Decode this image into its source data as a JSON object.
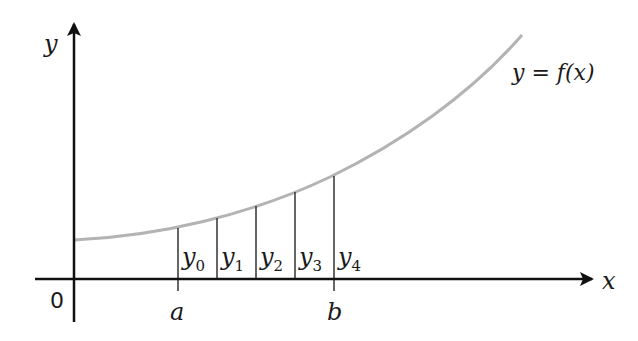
{
  "diagram": {
    "axes": {
      "x_label": "x",
      "y_label": "y",
      "origin_label": "0"
    },
    "curve": {
      "label": "y = f(x)",
      "color": "#b3b3b3"
    },
    "interval": {
      "start_label": "a",
      "end_label": "b"
    },
    "ordinates": [
      {
        "name": "y",
        "sub": "0"
      },
      {
        "name": "y",
        "sub": "1"
      },
      {
        "name": "y",
        "sub": "2"
      },
      {
        "name": "y",
        "sub": "3"
      },
      {
        "name": "y",
        "sub": "4"
      }
    ],
    "colors": {
      "axis": "#111111",
      "ordinate": "#333333",
      "curve": "#b3b3b3"
    }
  }
}
